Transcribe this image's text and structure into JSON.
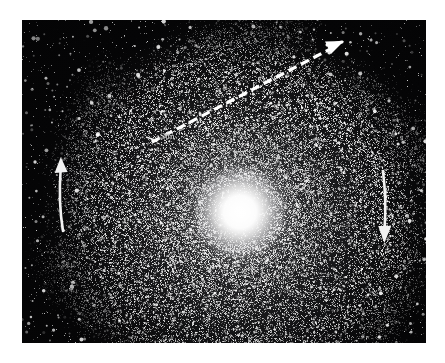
{
  "figure": {
    "name": "milky-way-spiral-galaxy-plate",
    "caption": "",
    "background_color": "#ffffff",
    "plate_color": "#050506",
    "star_color": "#ffffff",
    "annotation_color": "#ffffff"
  },
  "plate": {
    "x": 22,
    "y": 20,
    "width": 404,
    "height": 323
  },
  "galaxy": {
    "center_x": 218,
    "center_y": 192,
    "core_label": "",
    "arm_count": 6,
    "outer_radius": 200,
    "core_radius": 26
  },
  "labels": {
    "sun": "Sun",
    "marker_a": "A",
    "marker_b": "B",
    "core_faint": ""
  },
  "annotations": {
    "sight_line": {
      "name": "dashed-sight-line-arrow",
      "style": "dashed",
      "direction": "up-right",
      "from_x": 130,
      "from_y": 122,
      "to_x": 320,
      "to_y": 22
    },
    "rotation_left": {
      "name": "left-rotation-arrow",
      "direction": "up",
      "x": 40,
      "y_top": 139,
      "y_bottom": 210
    },
    "rotation_right": {
      "name": "right-rotation-arrow",
      "direction": "down",
      "x": 362,
      "y_top": 152,
      "y_bottom": 222
    }
  },
  "colors": {
    "plate": "#050506",
    "page": "#ffffff",
    "annotation": "#ffffff",
    "label_text": "#e9e9e9"
  }
}
